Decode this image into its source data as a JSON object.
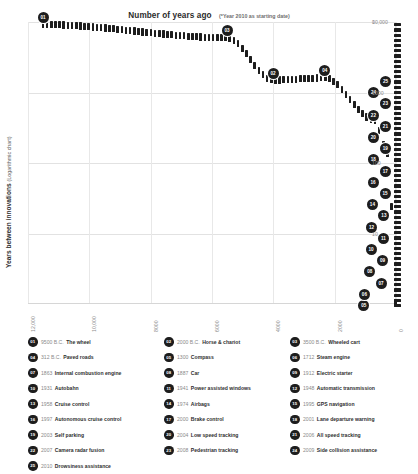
{
  "chart_data": {
    "type": "line",
    "title": "Number of years ago",
    "subtitle": "(*Year 2010 as starting date)",
    "xlabel": "",
    "ylabel": "Years between innovations",
    "ylabel_sub": "(Logarithmic chart)",
    "yscale": "log",
    "ylim": [
      1,
      10000
    ],
    "xlim": [
      12000,
      0
    ],
    "x_reversed": true,
    "grid": true,
    "legend_position": "below",
    "y_ticks": [
      "10",
      "100",
      "1000",
      "10,000"
    ],
    "y_tick_values": [
      10,
      100,
      1000,
      10000
    ],
    "y_tick_top": "0",
    "x_ticks": [
      "12,000",
      "10,000",
      "8000",
      "6000",
      "4000",
      "2000",
      "0"
    ],
    "x_tick_values": [
      12000,
      10000,
      8000,
      6000,
      4000,
      2000,
      0
    ],
    "series_name": "Years between innovations",
    "points": [
      {
        "id": "01",
        "year": "9500 B.C.",
        "name": "The wheel",
        "years_ago": 11510,
        "gap": 9188
      },
      {
        "id": "02",
        "year": "2000 B.C.",
        "name": "Horse & chariot",
        "years_ago": 4010,
        "gap": 1500
      },
      {
        "id": "03",
        "year": "3500 B.C.",
        "name": "Wheeled cart",
        "years_ago": 5510,
        "gap": 6000
      },
      {
        "id": "04",
        "year": "312 B.C.",
        "name": "Paved roads",
        "years_ago": 2322,
        "gap": 1612
      },
      {
        "id": "05",
        "year": "1300",
        "name": "Compass",
        "years_ago": 710,
        "gap": 412
      },
      {
        "id": "06",
        "year": "1712",
        "name": "Steam engine",
        "years_ago": 298,
        "gap": 151
      },
      {
        "id": "07",
        "year": "1863",
        "name": "Internal combustion engine",
        "years_ago": 147,
        "gap": 24
      },
      {
        "id": "08",
        "year": "1887",
        "name": "Car",
        "years_ago": 123,
        "gap": 25
      },
      {
        "id": "09",
        "year": "1912",
        "name": "Electric starter",
        "years_ago": 98,
        "gap": 19
      },
      {
        "id": "10",
        "year": "1931",
        "name": "Autobahn",
        "years_ago": 79,
        "gap": 10
      },
      {
        "id": "11",
        "year": "1941",
        "name": "Power assisted windows",
        "years_ago": 69,
        "gap": 7
      },
      {
        "id": "12",
        "year": "1948",
        "name": "Automatic transmission",
        "years_ago": 62,
        "gap": 10
      },
      {
        "id": "13",
        "year": "1958",
        "name": "Cruise control",
        "years_ago": 52,
        "gap": 16
      },
      {
        "id": "14",
        "year": "1974",
        "name": "Airbags",
        "years_ago": 36,
        "gap": 21
      },
      {
        "id": "15",
        "year": "1995",
        "name": "GPS navigation",
        "years_ago": 15,
        "gap": 2
      },
      {
        "id": "16",
        "year": "1997",
        "name": "Autonomous cruise control",
        "years_ago": 13,
        "gap": 3
      },
      {
        "id": "17",
        "year": "2000",
        "name": "Brake control",
        "years_ago": 10,
        "gap": 1
      },
      {
        "id": "18",
        "year": "2001",
        "name": "Lane departure warning",
        "years_ago": 9,
        "gap": 2
      },
      {
        "id": "19",
        "year": "2003",
        "name": "Self parking",
        "years_ago": 7,
        "gap": 1
      },
      {
        "id": "20",
        "year": "2004",
        "name": "Low speed tracking",
        "years_ago": 6,
        "gap": 2
      },
      {
        "id": "21",
        "year": "2006",
        "name": "All speed tracking",
        "years_ago": 4,
        "gap": 1
      },
      {
        "id": "22",
        "year": "2007",
        "name": "Camera radar fusion",
        "years_ago": 3,
        "gap": 1
      },
      {
        "id": "23",
        "year": "2008",
        "name": "Pedestrian tracking",
        "years_ago": 2,
        "gap": 1
      },
      {
        "id": "24",
        "year": "2009",
        "name": "Side collision assistance",
        "years_ago": 1,
        "gap": 1
      },
      {
        "id": "25",
        "year": "2010",
        "name": "Drowsiness assistance",
        "years_ago": 0,
        "gap": 1
      }
    ]
  },
  "legend": {
    "columns": [
      [
        {
          "id": "01",
          "year": "9500 B.C.",
          "name": "The wheel"
        },
        {
          "id": "04",
          "year": "312 B.C.",
          "name": "Paved roads"
        },
        {
          "id": "07",
          "year": "1863",
          "name": "Internal combustion engine"
        },
        {
          "id": "10",
          "year": "1931",
          "name": "Autobahn"
        },
        {
          "id": "13",
          "year": "1958",
          "name": "Cruise control"
        },
        {
          "id": "16",
          "year": "1997",
          "name": "Autonomous cruise control"
        },
        {
          "id": "19",
          "year": "2003",
          "name": "Self parking"
        },
        {
          "id": "22",
          "year": "2007",
          "name": "Camera radar fusion"
        },
        {
          "id": "25",
          "year": "2010",
          "name": "Drowsiness assistance"
        }
      ],
      [
        {
          "id": "02",
          "year": "2000 B.C.",
          "name": "Horse & chariot"
        },
        {
          "id": "05",
          "year": "1300",
          "name": "Compass"
        },
        {
          "id": "08",
          "year": "1887",
          "name": "Car"
        },
        {
          "id": "11",
          "year": "1941",
          "name": "Power assisted windows"
        },
        {
          "id": "14",
          "year": "1974",
          "name": "Airbags"
        },
        {
          "id": "17",
          "year": "2000",
          "name": "Brake control"
        },
        {
          "id": "20",
          "year": "2004",
          "name": "Low speed tracking"
        },
        {
          "id": "23",
          "year": "2008",
          "name": "Pedestrian tracking"
        }
      ],
      [
        {
          "id": "03",
          "year": "3500 B.C.",
          "name": "Wheeled cart"
        },
        {
          "id": "06",
          "year": "1712",
          "name": "Steam engine"
        },
        {
          "id": "09",
          "year": "1912",
          "name": "Electric starter"
        },
        {
          "id": "12",
          "year": "1948",
          "name": "Automatic transmission"
        },
        {
          "id": "15",
          "year": "1995",
          "name": "GPS navigation"
        },
        {
          "id": "18",
          "year": "2001",
          "name": "Lane departure warning"
        },
        {
          "id": "21",
          "year": "2006",
          "name": "All speed tracking"
        },
        {
          "id": "24",
          "year": "2009",
          "name": "Side collision assistance"
        }
      ]
    ]
  },
  "colors": {
    "mark": "#1d1d1d",
    "grid": "#e2e2e2",
    "axis_text": "#8d8d8d",
    "title": "#2b2b2b",
    "background": "#ffffff"
  }
}
